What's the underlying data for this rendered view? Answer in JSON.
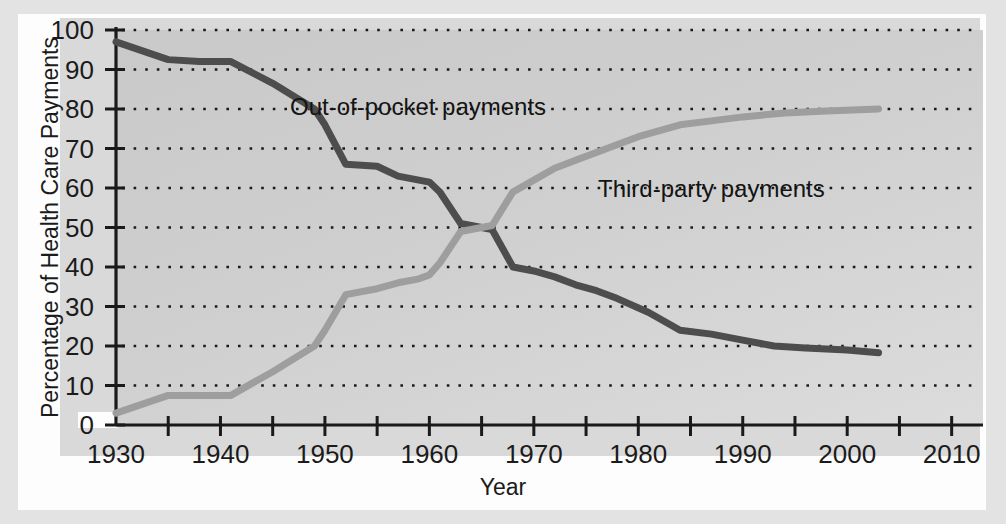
{
  "chart_data": {
    "type": "line",
    "title": "",
    "xlabel": "Year",
    "ylabel": "Percentage of Health Care Payments",
    "xlim": [
      1930,
      2013
    ],
    "ylim": [
      0,
      100
    ],
    "grid": true,
    "grid_style": "dotted-horizontal",
    "legend_position": "inline-annotations",
    "x_ticks": [
      1930,
      1940,
      1950,
      1960,
      1970,
      1980,
      1990,
      2000,
      2010
    ],
    "x_minor_tick_interval": 5,
    "y_ticks": [
      0,
      10,
      20,
      30,
      40,
      50,
      60,
      70,
      80,
      90,
      100
    ],
    "colors": {
      "out_of_pocket": "#4d4d4d",
      "third_party": "#9e9e9e",
      "plot_background": "#cdcdcd",
      "panel_background": "#d9d9d9",
      "gridline": "#1a1a1a",
      "axis": "#1a1a1a"
    },
    "series": [
      {
        "name": "Out-of-pocket payments",
        "color": "#4d4d4d",
        "points": [
          [
            1930,
            97.0
          ],
          [
            1935,
            92.5
          ],
          [
            1938,
            92.0
          ],
          [
            1941,
            92.0
          ],
          [
            1945,
            86.5
          ],
          [
            1949,
            80.0
          ],
          [
            1950,
            76.0
          ],
          [
            1952,
            66.0
          ],
          [
            1955,
            65.5
          ],
          [
            1957,
            63.0
          ],
          [
            1959,
            62.0
          ],
          [
            1960,
            61.5
          ],
          [
            1961,
            59.0
          ],
          [
            1963,
            51.0
          ],
          [
            1964,
            50.5
          ],
          [
            1965,
            50.0
          ],
          [
            1966,
            49.5
          ],
          [
            1968,
            40.0
          ],
          [
            1970,
            39.0
          ],
          [
            1972,
            37.5
          ],
          [
            1974,
            35.5
          ],
          [
            1976,
            34.0
          ],
          [
            1978,
            32.0
          ],
          [
            1981,
            28.5
          ],
          [
            1984,
            24.0
          ],
          [
            1987,
            23.0
          ],
          [
            1990,
            21.5
          ],
          [
            1993,
            20.0
          ],
          [
            1996,
            19.5
          ],
          [
            2000,
            19.0
          ],
          [
            2003,
            18.3
          ]
        ]
      },
      {
        "name": "Third-party payments",
        "color": "#9e9e9e",
        "points": [
          [
            1930,
            3.0
          ],
          [
            1935,
            7.5
          ],
          [
            1938,
            7.5
          ],
          [
            1941,
            7.5
          ],
          [
            1945,
            13.5
          ],
          [
            1949,
            20.0
          ],
          [
            1950,
            24.0
          ],
          [
            1952,
            33.0
          ],
          [
            1955,
            34.5
          ],
          [
            1957,
            36.0
          ],
          [
            1959,
            37.0
          ],
          [
            1960,
            38.0
          ],
          [
            1961,
            41.0
          ],
          [
            1963,
            49.0
          ],
          [
            1964,
            49.5
          ],
          [
            1965,
            50.0
          ],
          [
            1966,
            50.5
          ],
          [
            1968,
            59.0
          ],
          [
            1970,
            62.0
          ],
          [
            1972,
            65.0
          ],
          [
            1974,
            67.0
          ],
          [
            1977,
            70.0
          ],
          [
            1980,
            73.0
          ],
          [
            1984,
            76.0
          ],
          [
            1987,
            77.0
          ],
          [
            1990,
            78.0
          ],
          [
            1994,
            79.0
          ],
          [
            1998,
            79.5
          ],
          [
            2003,
            80.0
          ]
        ]
      }
    ],
    "annotations": [
      {
        "text": "Out-of-pocket payments",
        "x": 1953,
        "y": 86
      },
      {
        "text": "Third-party payments",
        "x": 1979,
        "y": 64
      }
    ]
  },
  "axes": {
    "y_title": "Percentage of Health Care Payments",
    "x_title": "Year",
    "y_tick_labels": [
      "100",
      "90",
      "80",
      "70",
      "60",
      "50",
      "40",
      "30",
      "20",
      "10",
      "0"
    ],
    "x_tick_labels": [
      "1930",
      "1940",
      "1950",
      "1960",
      "1970",
      "1980",
      "1990",
      "2000",
      "2010"
    ]
  },
  "labels": {
    "out_of_pocket": "Out-of-pocket payments",
    "third_party": "Third-party payments"
  }
}
